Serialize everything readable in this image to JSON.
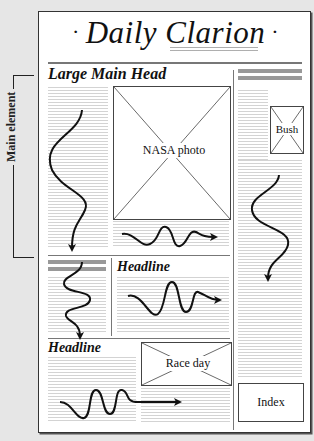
{
  "masthead": {
    "title": "Daily Clarion",
    "left_ornament": "·",
    "right_ornament": "·"
  },
  "annotation": {
    "bracket_label": "Main element"
  },
  "stories": {
    "main": {
      "headline": "Large Main Head",
      "photo_caption": "NASA photo"
    },
    "sidebar": {
      "photo_caption": "Bush"
    },
    "secondary": {
      "headline": "Headline"
    },
    "bottom": {
      "headline": "Headline",
      "photo_caption": "Race day"
    },
    "index": {
      "label": "Index"
    }
  },
  "colors": {
    "background": "#e6e6e6",
    "page": "#ffffff",
    "ink": "#111111",
    "rule": "#777777",
    "greek_text": "#d3d3d3",
    "bar": "#999999"
  }
}
